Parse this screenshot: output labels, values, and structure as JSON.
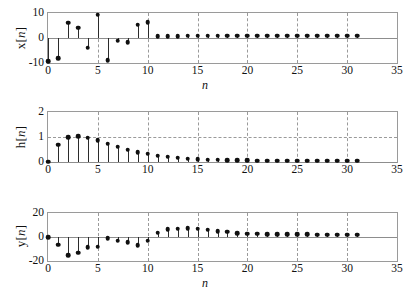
{
  "figure": {
    "background": "#ffffff",
    "stem_color": "#2b2b2b",
    "marker_color": "#101010",
    "axis_color": "#9a9a9a",
    "grid_color": "#9a9a9a"
  },
  "chart_data": [
    {
      "type": "line",
      "name": "x[n]",
      "title": "",
      "xlabel": "n",
      "ylabel": "x[n]",
      "xlim": [
        0,
        35
      ],
      "ylim": [
        -10,
        10
      ],
      "xticks": [
        0,
        5,
        10,
        15,
        20,
        25,
        30,
        35
      ],
      "yticks": [
        -10,
        0,
        10
      ],
      "grid": true,
      "grid_x": [
        5,
        10,
        15,
        20,
        25,
        30
      ],
      "grid_y": [],
      "legend": "none",
      "x": [
        0,
        1,
        2,
        3,
        4,
        5,
        6,
        7,
        8,
        9,
        10,
        11,
        12,
        13,
        14,
        15,
        16,
        17,
        18,
        19,
        20,
        21,
        22,
        23,
        24,
        25,
        26,
        27,
        28,
        29,
        30,
        31
      ],
      "values": [
        -9.3,
        -8.1,
        6.1,
        4.2,
        -3.9,
        9.4,
        -8.9,
        -1.0,
        -1.7,
        5.4,
        6.4,
        0.8,
        0.8,
        0.8,
        0.9,
        0.9,
        0.9,
        0.9,
        1.0,
        1.0,
        1.0,
        1.0,
        1.0,
        1.0,
        1.0,
        1.0,
        1.0,
        1.0,
        1.0,
        1.0,
        1.0,
        1.0
      ]
    },
    {
      "type": "line",
      "name": "h[n]",
      "title": "",
      "xlabel": "n",
      "ylabel": "h[n]",
      "xlim": [
        0,
        35
      ],
      "ylim": [
        0,
        2
      ],
      "xticks": [
        0,
        5,
        10,
        15,
        20,
        25,
        30,
        35
      ],
      "yticks": [
        0,
        1,
        2
      ],
      "grid": true,
      "grid_x": [
        5,
        10,
        15,
        20,
        25,
        30
      ],
      "grid_y": [
        1
      ],
      "legend": "none",
      "x": [
        0,
        1,
        2,
        3,
        4,
        5,
        6,
        7,
        8,
        9,
        10,
        11,
        12,
        13,
        14,
        15,
        16,
        17,
        18,
        19,
        20,
        21,
        22,
        23,
        24,
        25,
        26,
        27,
        28,
        29,
        30,
        31
      ],
      "values": [
        0.02,
        0.7,
        1.0,
        1.04,
        0.98,
        0.87,
        0.74,
        0.61,
        0.49,
        0.4,
        0.33,
        0.26,
        0.21,
        0.17,
        0.14,
        0.12,
        0.1,
        0.09,
        0.08,
        0.07,
        0.07,
        0.06,
        0.06,
        0.06,
        0.06,
        0.05,
        0.05,
        0.05,
        0.05,
        0.05,
        0.05,
        0.05
      ]
    },
    {
      "type": "line",
      "name": "y[n]",
      "title": "",
      "xlabel": "n",
      "ylabel": "y[n]",
      "xlim": [
        0,
        35
      ],
      "ylim": [
        -20,
        20
      ],
      "xticks": [
        0,
        5,
        10,
        15,
        20,
        25,
        30,
        35
      ],
      "yticks": [
        -20,
        0,
        20
      ],
      "grid": true,
      "grid_x": [
        5,
        10,
        15,
        20,
        25,
        30
      ],
      "grid_y": [],
      "legend": "none",
      "x": [
        0,
        1,
        2,
        3,
        4,
        5,
        6,
        7,
        8,
        9,
        10,
        11,
        12,
        13,
        14,
        15,
        16,
        17,
        18,
        19,
        20,
        21,
        22,
        23,
        24,
        25,
        26,
        27,
        28,
        29,
        30,
        31
      ],
      "values": [
        0.0,
        -6.5,
        -15.0,
        -13.0,
        -8.5,
        -8.0,
        -0.8,
        -3.2,
        -4.4,
        -7.0,
        -3.0,
        3.5,
        6.5,
        7.0,
        7.2,
        7.0,
        6.2,
        5.0,
        4.3,
        3.4,
        2.8,
        2.6,
        2.4,
        2.3,
        2.2,
        2.1,
        2.1,
        2.0,
        2.0,
        2.0,
        2.0,
        2.0
      ]
    }
  ]
}
